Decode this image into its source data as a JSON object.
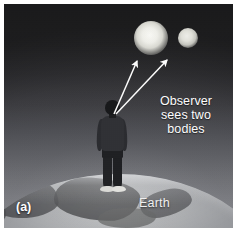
{
  "figure": {
    "panel_label": "(a)",
    "annotation": {
      "line1": "Observer",
      "line2": "sees two",
      "line3": "bodies"
    },
    "earth_label": "Earth",
    "colors": {
      "sky_top": "#232325",
      "sky_horizon": "#8a8b90",
      "body_light": "#fafaf6",
      "arrow": "#ffffff",
      "earth_base": "#95979b",
      "earth_land": "#4a4b4e",
      "text": "#ffffff",
      "border": "#ffffff"
    },
    "elements": {
      "body_large": "large-celestial-body",
      "body_small": "small-celestial-body",
      "arrow_left": "sight-line-arrow-to-large-body",
      "arrow_right": "sight-line-arrow-to-small-body",
      "observer": "observer-figure",
      "earth": "earth-surface"
    }
  }
}
